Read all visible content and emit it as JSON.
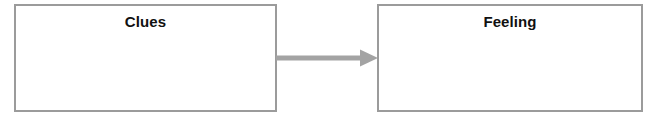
{
  "diagram": {
    "type": "flow-diagram",
    "title": "",
    "background_color": "#ffffff",
    "canvas": {
      "width": 657,
      "height": 120
    },
    "nodes": [
      {
        "id": "clues",
        "label": "Clues",
        "shape": "rectangle",
        "border_color": "#9b9b9b",
        "fill_color": "#ffffff",
        "text_color": "#111111",
        "x": 14,
        "y": 4,
        "width": 263,
        "height": 108
      },
      {
        "id": "feeling",
        "label": "Feeling",
        "shape": "rectangle",
        "border_color": "#9b9b9b",
        "fill_color": "#ffffff",
        "text_color": "#111111",
        "x": 377,
        "y": 4,
        "width": 266,
        "height": 108
      }
    ],
    "edges": [
      {
        "id": "clues-to-feeling",
        "from": "clues",
        "to": "feeling",
        "label": "",
        "style": "solid-arrow",
        "direction": "right",
        "color": "#a3a3a3"
      }
    ]
  }
}
